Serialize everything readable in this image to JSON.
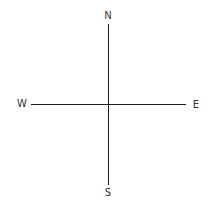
{
  "compass": {
    "north": "N",
    "south": "S",
    "east": "E",
    "west": "W",
    "line_color": "#1a1a1a",
    "label_color": "#333333"
  }
}
